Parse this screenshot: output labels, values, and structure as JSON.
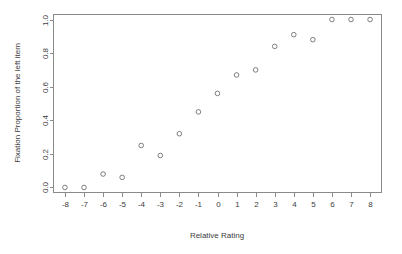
{
  "chart_data": {
    "type": "scatter",
    "title": "",
    "xlabel": "Relative Rating",
    "ylabel": "Fixation Proportion of the left item",
    "xlim": [
      -8.6,
      8.6
    ],
    "ylim": [
      -0.03,
      1.03
    ],
    "xticks": [
      -8,
      -7,
      -6,
      -5,
      -4,
      -3,
      -2,
      -1,
      0,
      1,
      2,
      3,
      4,
      5,
      6,
      7,
      8
    ],
    "xticklabels": [
      "-8",
      "-7",
      "-6",
      "-5",
      "-4",
      "-3",
      "-2",
      "-1",
      "0",
      "1",
      "2",
      "3",
      "4",
      "5",
      "6",
      "7",
      "8"
    ],
    "yticks": [
      0.0,
      0.2,
      0.4,
      0.6,
      0.8,
      1.0
    ],
    "yticklabels": [
      "0.0",
      "0.2",
      "0.4",
      "0.6",
      "0.8",
      "1.0"
    ],
    "grid": false,
    "legend": null,
    "marker": "open-circle",
    "marker_color": "#6f6f6f",
    "x": [
      -8,
      -7,
      -6,
      -5,
      -4,
      -3,
      -2,
      -1,
      0,
      1,
      2,
      3,
      4,
      5,
      6,
      7,
      8
    ],
    "values": [
      0.0,
      0.0,
      0.08,
      0.06,
      0.25,
      0.19,
      0.32,
      0.45,
      0.56,
      0.67,
      0.7,
      0.84,
      0.91,
      0.88,
      1.0,
      1.0,
      1.0
    ]
  }
}
